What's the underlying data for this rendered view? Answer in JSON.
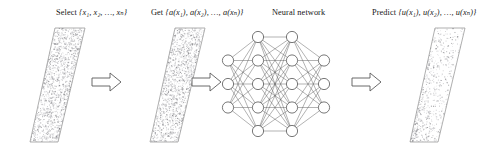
{
  "diagram": {
    "type": "pipeline-flow-diagram",
    "background": "#ffffff",
    "stroke_color": "#6f6f6f",
    "text_color": "#161616",
    "stages": [
      {
        "id": "stage-select",
        "label": "Select {x1, x2, ..., xn}",
        "label_parts": {
          "verb": "Select",
          "set": "{x₁, x₂, …, xₙ}"
        },
        "shape": "parallelogram",
        "texture": "dense-speckle",
        "texture_density": "high",
        "texture_distribution": "uniform"
      },
      {
        "id": "stage-get",
        "label": "Get {a(x1), a(x2), ..., a(xn)}",
        "label_parts": {
          "verb": "Get",
          "set": "{a(x₁), a(x₂), …, a(xₙ)}"
        },
        "shape": "parallelogram",
        "texture": "dense-speckle",
        "texture_density": "high",
        "texture_distribution": "uniform"
      },
      {
        "id": "stage-network",
        "label": "Neural network",
        "label_parts": {
          "verb": "Neural network",
          "set": ""
        },
        "shape": "neural-network-graph",
        "layers": [
          3,
          5,
          5,
          3
        ],
        "layer_names": [
          "input-layer",
          "hidden-layer-1",
          "hidden-layer-2",
          "output-layer"
        ],
        "node_fill": "#ffffff",
        "node_stroke": "#555555",
        "edge_stroke": "#555555",
        "fully_connected": true
      },
      {
        "id": "stage-predict",
        "label": "Predict {u(x1), u(x2), ..., u(xn)}",
        "label_parts": {
          "verb": "Predict",
          "set": "{u(x₁), u(x₂), …, u(xₙ)}"
        },
        "shape": "parallelogram",
        "texture": "sparse-speckle",
        "texture_density": "low",
        "texture_distribution": "left-weighted"
      }
    ],
    "arrows": [
      {
        "id": "arrow-1",
        "from": "stage-select",
        "to": "stage-get",
        "style": "hollow-block-arrow",
        "direction": "right"
      },
      {
        "id": "arrow-2",
        "from": "stage-get",
        "to": "stage-network",
        "style": "hollow-block-arrow",
        "direction": "right"
      },
      {
        "id": "arrow-3",
        "from": "stage-network",
        "to": "stage-predict",
        "style": "hollow-block-arrow",
        "direction": "right"
      }
    ]
  }
}
